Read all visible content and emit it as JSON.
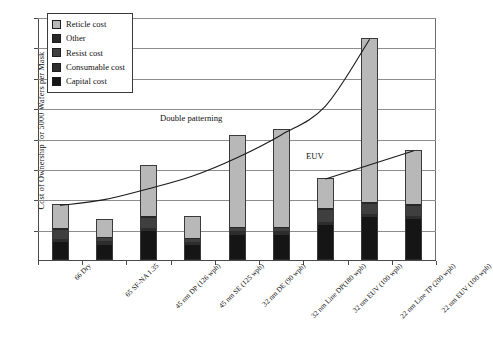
{
  "chart_data": {
    "type": "bar",
    "subtype": "stacked-bar-with-lines",
    "title": "",
    "xlabel": "",
    "ylabel": "Cost of Ownership for 5000 Wafers per Mask",
    "ylim": [
      0,
      8
    ],
    "y_tick_labels": [],
    "gridlines": 8,
    "grid": true,
    "legend_position": "top-left",
    "categories": [
      "66 Dry",
      "65 SF-NA 1.35",
      "45 nm DP (126 wph)",
      "45 nm SE (125 wph)",
      "32 nm DE (90 wph)",
      "32 nm Line DP(180 wph)",
      "32 nm EUV (100 wph)",
      "22 nm Line TP (200 wph)",
      "22 nm EUV (100 wph)"
    ],
    "series": [
      {
        "name": "Capital cost",
        "color": "#151515",
        "values": [
          0.58,
          0.5,
          0.95,
          0.5,
          0.82,
          0.82,
          1.15,
          1.42,
          1.35
        ]
      },
      {
        "name": "Consumable cost",
        "color": "#2d2d2d",
        "values": [
          0.1,
          0.12,
          0.12,
          0.1,
          0.12,
          0.12,
          0.1,
          0.1,
          0.1
        ]
      },
      {
        "name": "Resist cost",
        "color": "#3f3f3f",
        "values": [
          0.32,
          0.1,
          0.33,
          0.1,
          0.1,
          0.1,
          0.4,
          0.33,
          0.33
        ]
      },
      {
        "name": "Other",
        "color": "#272727",
        "values": [
          0.05,
          0.04,
          0.06,
          0.04,
          0.04,
          0.04,
          0.05,
          0.05,
          0.05
        ]
      },
      {
        "name": "Reticle cost",
        "color": "#b8b8b8",
        "values": [
          0.78,
          0.6,
          1.68,
          0.7,
          3.05,
          3.22,
          1.0,
          5.4,
          1.8
        ]
      }
    ],
    "totals": [
      1.83,
      1.36,
      3.14,
      1.44,
      4.13,
      4.3,
      2.7,
      7.3,
      3.63
    ],
    "lines": [
      {
        "name": "Double patterning",
        "label": "Double patterning",
        "points": [
          {
            "x": 0,
            "y": 1.83
          },
          {
            "x": 1,
            "y": 2.02
          },
          {
            "x": 2,
            "y": 2.38
          },
          {
            "x": 3,
            "y": 2.8
          },
          {
            "x": 4,
            "y": 3.4
          },
          {
            "x": 5,
            "y": 4.15
          },
          {
            "x": 6,
            "y": 5.1
          },
          {
            "x": 7,
            "y": 7.3
          }
        ]
      },
      {
        "name": "EUV",
        "label": "EUV",
        "points": [
          {
            "x": 6,
            "y": 2.7
          },
          {
            "x": 8,
            "y": 3.63
          }
        ]
      }
    ],
    "annotations": [
      {
        "text": "Double patterning",
        "x_frac": 0.33,
        "y_frac": 0.42
      },
      {
        "text": "EUV",
        "x_frac": 0.68,
        "y_frac": 0.58
      }
    ]
  },
  "legend": {
    "items": [
      {
        "label": "Reticle cost",
        "color": "#b8b8b8"
      },
      {
        "label": "Other",
        "color": "#272727"
      },
      {
        "label": "Resist cost",
        "color": "#3f3f3f"
      },
      {
        "label": "Consumable cost",
        "color": "#2d2d2d"
      },
      {
        "label": "Capital cost",
        "color": "#151515"
      }
    ]
  },
  "axis": {
    "y_title": "Cost of Ownership for 5000 Wafers per Mask"
  },
  "annotations": {
    "double_patterning": "Double patterning",
    "euv": "EUV"
  }
}
